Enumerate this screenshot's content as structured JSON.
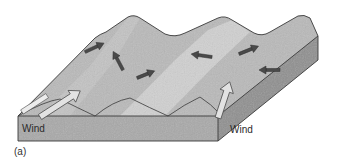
{
  "figure": {
    "panel_label": "(a)",
    "labels": {
      "wind_left": "Wind",
      "wind_right": "Wind"
    },
    "colors": {
      "top_surface": "#b9b9b9",
      "light_stripe": "#d6d6d6",
      "front_face": "#a9a9a9",
      "side_face": "#8f8f8f",
      "outline": "#3a3a3a",
      "arrow_dark": "#4a4a4a",
      "wind_arrow_fill": "#e2e2e2"
    },
    "arrows": [
      {
        "name": "arrow-upper-left-1",
        "direction": "up-right"
      },
      {
        "name": "arrow-upper-left-2",
        "direction": "up-left"
      },
      {
        "name": "arrow-middle",
        "direction": "up-right"
      },
      {
        "name": "arrow-upper-right-1",
        "direction": "left"
      },
      {
        "name": "arrow-upper-right-2",
        "direction": "up-right"
      },
      {
        "name": "arrow-right",
        "direction": "left"
      }
    ]
  }
}
